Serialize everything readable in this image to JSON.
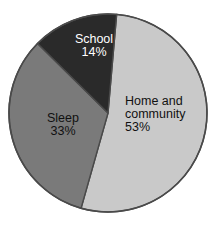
{
  "chart_data": {
    "type": "pie",
    "title": "",
    "subtitle": "",
    "xlabel": "",
    "ylabel": "",
    "legend_position": "none",
    "grid": false,
    "labels_inside_slices": true,
    "start_angle_deg": 5,
    "direction": "clockwise",
    "categories": [
      "Home and community",
      "Sleep",
      "School"
    ],
    "values": [
      53,
      33,
      14
    ],
    "value_unit": "%",
    "slices": [
      {
        "name": "Home and community",
        "label_lines": [
          "Home and",
          "community",
          "53%"
        ],
        "value": 53,
        "value_text": "53%",
        "color": "#c9c9c9",
        "text_color": "#111111"
      },
      {
        "name": "Sleep",
        "label_lines": [
          "Sleep",
          "33%"
        ],
        "value": 33,
        "value_text": "33%",
        "color": "#7a7a7a",
        "text_color": "#111111"
      },
      {
        "name": "School",
        "label_lines": [
          "School",
          "14%"
        ],
        "value": 14,
        "value_text": "14%",
        "color": "#2a2a2a",
        "text_color": "#ffffff"
      }
    ]
  },
  "figure": {
    "background_color": "#ffffff",
    "outline_color": "#4a4a4a",
    "center_x": 108,
    "center_y": 113,
    "radius": 99
  }
}
